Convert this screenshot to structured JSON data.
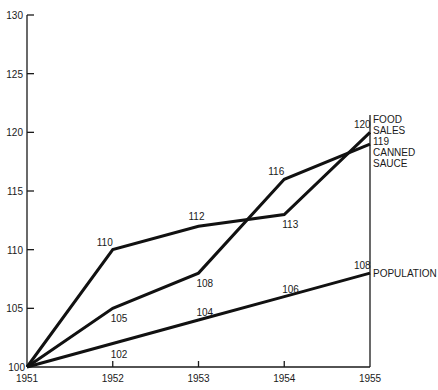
{
  "chart_data": {
    "type": "line",
    "title": "",
    "xlabel": "",
    "ylabel": "",
    "x": [
      "1951",
      "1952",
      "1953",
      "1954",
      "1955"
    ],
    "ylim": [
      100,
      130
    ],
    "yticks": [
      100,
      105,
      110,
      115,
      120,
      125,
      130
    ],
    "grid": false,
    "series": [
      {
        "name": "FOOD SALES",
        "values": [
          100,
          110,
          112,
          113,
          120
        ],
        "labels": [
          "",
          "110",
          "112",
          "113",
          "120"
        ],
        "end_label": [
          "FOOD",
          "SALES"
        ]
      },
      {
        "name": "CANNED SAUCE",
        "values": [
          100,
          105,
          108,
          116,
          119
        ],
        "labels": [
          "",
          "105",
          "108",
          "116",
          "119"
        ],
        "end_label": [
          "119",
          "CANNED",
          "SAUCE"
        ]
      },
      {
        "name": "POPULATION",
        "values": [
          100,
          102,
          104,
          106,
          108
        ],
        "labels": [
          "",
          "102",
          "104",
          "106",
          "108"
        ],
        "end_label": [
          "POPULATION"
        ]
      }
    ],
    "origin_label": "100"
  }
}
